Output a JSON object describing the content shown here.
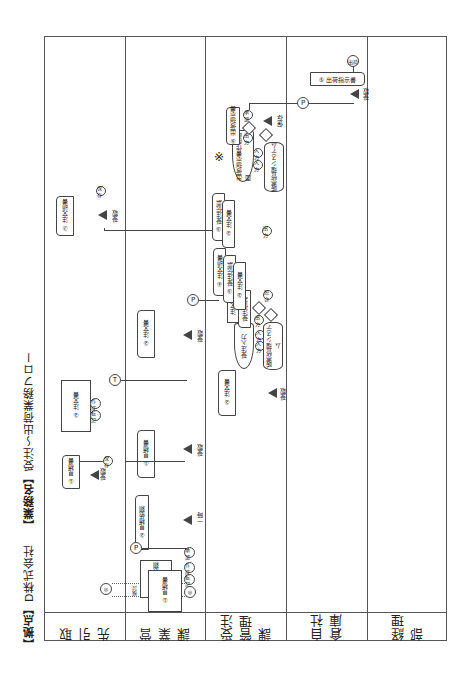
{
  "title": {
    "location_label": "【拠点】",
    "location": "D株式会社",
    "business_label": "【業務名】",
    "business": "受注～出荷業務フロー"
  },
  "lanes": [
    {
      "label": "取引先"
    },
    {
      "label": "営業課"
    },
    {
      "label": "受注管理課"
    },
    {
      "label": "自社倉庫"
    },
    {
      "label": "経理部"
    }
  ],
  "nodes": {
    "torihiki": {
      "start_label": "◎",
      "mitsumori_irai": "① 見積依頼",
      "mitsumori_irai2": "② 見積依頼",
      "mitsumorisho": "① 見積書",
      "chumonsho": "② 注文書",
      "chumon_ukesho": "⑦ 注文請書",
      "sakusei": "作成",
      "tenki": "転記",
      "hozon1": "保存",
      "hozon2": "保存",
      "juryo1": "受取",
      "juryo2": "受取",
      "ichiji": "一時",
      "kentou": "検討"
    },
    "eigyo": {
      "mitsumori_irai": "① 見積依頼",
      "mitsumori_irai_copy": "② 見積依頼",
      "mitsumorisho": "① 見積書",
      "chumonsho": "② 注文書",
      "juryo": "受取",
      "ichiji": "一時",
      "shonin": "承認",
      "sakusei": "作成",
      "tenki": "転記",
      "end_label": "◎",
      "connector_p": "P",
      "connector_t": "T"
    },
    "juchu": {
      "chumonsho_in": "② 注文書",
      "juryo": "受取",
      "juchu_input": "受注入力",
      "system1": "販売管理システム",
      "chumon_ukesho_doc": "注文請書",
      "juchu_kakunin_doc": "受注伝票",
      "chumonsho_a": "② 注文書",
      "juchu_denpyo_a": "③ 受注伝票",
      "chumon_ukesho_a": "④ 注文請書",
      "chumonsho_b": "② 注文書",
      "juchu_denpyo_b": "③ 受注伝票",
      "shukka_sakusei": "出荷指示書作成画面",
      "shukka_shiji": "⑤ 出荷指示書",
      "system2": "販売管理システム",
      "hozon": "保存",
      "note_mark": "※",
      "kigou_in": "入力",
      "kigou_out": "出力",
      "kigou_check": "照合",
      "kigou_shonin": "承認"
    },
    "soko": {
      "shukka_shiji": "⑤ 出荷指示書",
      "juryo": "受取",
      "shukka": "出荷",
      "connector_p": "P"
    }
  }
}
